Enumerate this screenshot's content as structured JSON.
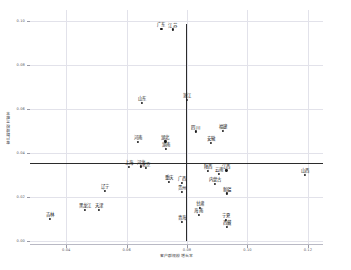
{
  "chart_data": {
    "type": "scatter",
    "title": "",
    "xlabel": "客户群规模增长率",
    "ylabel": "客户群规模贡献率",
    "xlim": [
      0.028,
      0.125
    ],
    "ylim": [
      -0.002,
      0.105
    ],
    "xticks": [
      0.04,
      0.06,
      0.08,
      0.1,
      0.12
    ],
    "xticklabels": [
      "0.04",
      "0.06",
      "0.08",
      "0.10",
      "0.12"
    ],
    "yticks": [
      0.0,
      0.02,
      0.04,
      0.06,
      0.08,
      0.1
    ],
    "yticklabels": [
      "0.00",
      "0.02",
      "0.04",
      "0.06",
      "0.08",
      "0.10"
    ],
    "grid": true,
    "legend": "none",
    "reference_lines": {
      "vertical_x": 0.0795,
      "horizontal_y": 0.0353,
      "color": "#2b2b2b"
    },
    "points": [
      {
        "label": "广东",
        "x": 0.0715,
        "y": 0.0965
      },
      {
        "label": "江苏",
        "x": 0.0752,
        "y": 0.0962
      },
      {
        "label": "浙江",
        "x": 0.08,
        "y": 0.064
      },
      {
        "label": "山东",
        "x": 0.065,
        "y": 0.0628
      },
      {
        "label": "四川",
        "x": 0.0828,
        "y": 0.0497
      },
      {
        "label": "福建",
        "x": 0.0918,
        "y": 0.05
      },
      {
        "label": "安徽",
        "x": 0.0878,
        "y": 0.0445
      },
      {
        "label": "河南",
        "x": 0.0638,
        "y": 0.045
      },
      {
        "label": "湖北",
        "x": 0.0728,
        "y": 0.0452
      },
      {
        "label": "湖南",
        "x": 0.073,
        "y": 0.0418
      },
      {
        "label": "上海",
        "x": 0.0608,
        "y": 0.0335
      },
      {
        "label": "河北",
        "x": 0.0648,
        "y": 0.0338
      },
      {
        "label": "北京",
        "x": 0.0665,
        "y": 0.033
      },
      {
        "label": "陕西",
        "x": 0.0868,
        "y": 0.0318
      },
      {
        "label": "江西",
        "x": 0.093,
        "y": 0.032
      },
      {
        "label": "云南",
        "x": 0.0905,
        "y": 0.0303
      },
      {
        "label": "山西",
        "x": 0.119,
        "y": 0.03
      },
      {
        "label": "重庆",
        "x": 0.074,
        "y": 0.0268
      },
      {
        "label": "广西",
        "x": 0.0782,
        "y": 0.0262
      },
      {
        "label": "内蒙古",
        "x": 0.0892,
        "y": 0.0258
      },
      {
        "label": "辽宁",
        "x": 0.0528,
        "y": 0.0228
      },
      {
        "label": "贵州",
        "x": 0.0783,
        "y": 0.0222
      },
      {
        "label": "新疆",
        "x": 0.0932,
        "y": 0.0215
      },
      {
        "label": "黑龙江",
        "x": 0.0462,
        "y": 0.014
      },
      {
        "label": "天津",
        "x": 0.0508,
        "y": 0.014
      },
      {
        "label": "甘肃",
        "x": 0.0842,
        "y": 0.015
      },
      {
        "label": "海南",
        "x": 0.0838,
        "y": 0.0118
      },
      {
        "label": "吉林",
        "x": 0.0345,
        "y": 0.0098
      },
      {
        "label": "青海",
        "x": 0.0782,
        "y": 0.0085
      },
      {
        "label": "宁夏",
        "x": 0.0928,
        "y": 0.0095
      },
      {
        "label": "西藏",
        "x": 0.0932,
        "y": 0.0062
      }
    ]
  }
}
